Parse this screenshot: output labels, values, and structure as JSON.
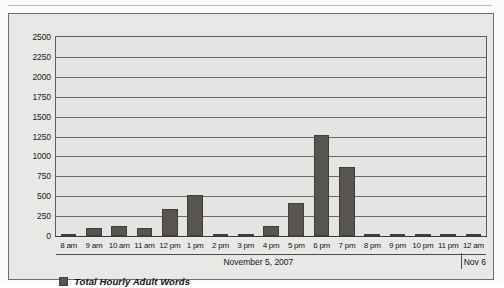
{
  "chart_data": {
    "type": "bar",
    "title": "",
    "xlabel": "November 5, 2007",
    "ylabel": "",
    "ylim": [
      0,
      2500
    ],
    "ytick_step": 250,
    "yticks": [
      2500,
      2250,
      2000,
      1750,
      1500,
      1250,
      1000,
      750,
      500,
      250,
      0
    ],
    "grid": true,
    "legend_position": "bottom-left",
    "categories": [
      "8 am",
      "9 am",
      "10 am",
      "11 am",
      "12 pm",
      "1 pm",
      "2 pm",
      "3 pm",
      "4 pm",
      "5 pm",
      "6 pm",
      "7 pm",
      "8 pm",
      "9 pm",
      "10 pm",
      "11 pm",
      "12 am"
    ],
    "series": [
      {
        "name": "Total Hourly Adult Words",
        "color": "#585551",
        "values": [
          30,
          105,
          120,
          100,
          340,
          520,
          15,
          10,
          130,
          420,
          1270,
          870,
          0,
          20,
          5,
          20,
          0
        ]
      }
    ],
    "group_axis": [
      {
        "label": "November 5, 2007",
        "start_category": "8 am",
        "end_category": "11 pm"
      },
      {
        "label": "Nov 6",
        "start_category": "12 am",
        "end_category": "12 am"
      }
    ]
  },
  "legend": {
    "swatch_name": "legend-color-swatch",
    "label": "Total Hourly Adult Words"
  }
}
